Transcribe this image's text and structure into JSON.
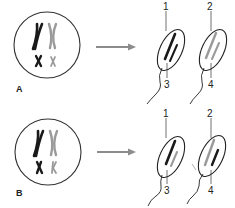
{
  "panels": [
    {
      "label": "A",
      "description": "Independent assortment: non-crossover",
      "mother_cell": {
        "chromosomes": [
          {
            "size": "large",
            "color": "black"
          },
          {
            "size": "large",
            "color": "gray"
          },
          {
            "size": "small",
            "color": "black"
          },
          {
            "size": "small",
            "color": "gray"
          }
        ]
      },
      "gametes": [
        {
          "chromosome_colors": [
            "black",
            "black"
          ],
          "top_label": "1",
          "bottom_label": "3"
        },
        {
          "chromosome_colors": [
            "gray",
            "gray"
          ],
          "top_label": "2",
          "bottom_label": "4"
        }
      ]
    },
    {
      "label": "B",
      "description": "Independent assortment: alternate combination",
      "mother_cell": {
        "chromosomes": [
          {
            "size": "large",
            "color": "black"
          },
          {
            "size": "large",
            "color": "gray"
          },
          {
            "size": "small",
            "color": "black"
          },
          {
            "size": "small",
            "color": "gray"
          }
        ]
      },
      "gametes": [
        {
          "chromosome_colors": [
            "black",
            "gray"
          ],
          "top_label": "1",
          "bottom_label": "3"
        },
        {
          "chromosome_colors": [
            "gray",
            "black"
          ],
          "top_label": "2",
          "bottom_label": "4"
        }
      ]
    }
  ],
  "colors": {
    "black_chromosome": "#1a1a1a",
    "gray_chromosome": "#9a9a9a",
    "arrow": "#8c8c8c",
    "outline": "#333333"
  }
}
